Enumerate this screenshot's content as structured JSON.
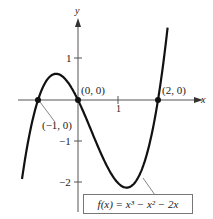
{
  "chart_data": {
    "type": "line",
    "title": "",
    "function_label": "f(x) = x³ − x² − 2x",
    "xlabel": "x",
    "ylabel": "y",
    "xlim": [
      -1.9,
      3.0
    ],
    "ylim": [
      -2.6,
      2.3
    ],
    "x_ticks": [
      1
    ],
    "x_tick_labels": [
      "1"
    ],
    "y_ticks": [
      1,
      -1,
      -2
    ],
    "y_tick_labels": [
      "1",
      "−1",
      "−2"
    ],
    "grid": false,
    "series": [
      {
        "name": "f(x) = x^3 - x^2 - 2x",
        "x": [
          -1.4,
          -1.0,
          -0.5,
          -0.215,
          0,
          0.5,
          1.0,
          1.215,
          1.5,
          2.0,
          2.4
        ],
        "y": [
          -1.9,
          0,
          0.625,
          0.631,
          0,
          -1.125,
          -2.0,
          -2.113,
          -1.875,
          0,
          3.1
        ]
      }
    ],
    "annotations": [
      {
        "text": "(−1, 0)",
        "x": -1,
        "y": 0
      },
      {
        "text": "(0, 0)",
        "x": 0,
        "y": 0
      },
      {
        "text": "(2, 0)",
        "x": 2,
        "y": 0
      }
    ]
  },
  "labels": {
    "y_axis": "y",
    "x_axis": "x",
    "tick_1_y": "1",
    "tick_m1_y": "−1",
    "tick_m2_y": "−2",
    "tick_1_x": "1",
    "pt_m1": "(−1, 0)",
    "pt_0": "(0, 0)",
    "pt_2": "(2, 0)",
    "func": "f(x) = x³ − x² − 2x"
  }
}
